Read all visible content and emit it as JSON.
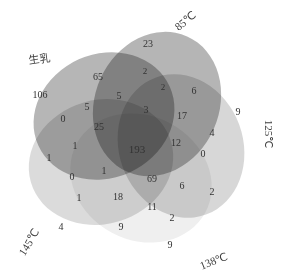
{
  "figure": {
    "type": "venn5",
    "title": "",
    "background": "#ffffff"
  },
  "sets": [
    {
      "id": "raw",
      "label": "生乳",
      "color": "#9a9a9a",
      "label_x": 40,
      "label_y": 60,
      "rotation": -8
    },
    {
      "id": "t85",
      "label": "85℃",
      "color": "#8e8e8e",
      "label_x": 186,
      "label_y": 22,
      "rotation": -38
    },
    {
      "id": "t125",
      "label": "125℃",
      "color": "#c3c3c3",
      "label_x": 268,
      "label_y": 134,
      "rotation": 90
    },
    {
      "id": "t138",
      "label": "138℃",
      "color": "#ececec",
      "label_x": 214,
      "label_y": 262,
      "rotation": -22
    },
    {
      "id": "t145",
      "label": "145℃",
      "color": "#c9c9c9",
      "label_x": 30,
      "label_y": 243,
      "rotation": -58
    }
  ],
  "chart_data": {
    "type": "venn",
    "sets": [
      "生乳",
      "85℃",
      "125℃",
      "138℃",
      "145℃"
    ],
    "title": "",
    "regions": [
      {
        "label": "106",
        "value": 106,
        "x": 40,
        "y": 96,
        "size": 10,
        "members": [
          "生乳"
        ]
      },
      {
        "label": "23",
        "value": 23,
        "x": 148,
        "y": 45,
        "size": 10,
        "members": [
          "85℃"
        ]
      },
      {
        "label": "9",
        "value": 9,
        "x": 238,
        "y": 113,
        "size": 10,
        "members": [
          "125℃"
        ]
      },
      {
        "label": "9",
        "value": 9,
        "x": 170,
        "y": 246,
        "size": 10,
        "members": [
          "138℃"
        ]
      },
      {
        "label": "4",
        "value": 4,
        "x": 61,
        "y": 228,
        "size": 10,
        "members": [
          "145℃"
        ]
      },
      {
        "label": "65",
        "value": 65,
        "x": 98,
        "y": 78,
        "size": 10,
        "members": [
          "生乳",
          "85℃"
        ]
      },
      {
        "label": "2",
        "value": 2,
        "x": 145,
        "y": 72,
        "size": 9,
        "members": [
          "85℃"
        ]
      },
      {
        "label": "2",
        "value": 2,
        "x": 163,
        "y": 88,
        "size": 9,
        "members": [
          "85℃",
          "125℃"
        ]
      },
      {
        "label": "6",
        "value": 6,
        "x": 194,
        "y": 92,
        "size": 10,
        "members": [
          "125℃"
        ]
      },
      {
        "label": "5",
        "value": 5,
        "x": 119,
        "y": 97,
        "size": 10,
        "members": [
          "生乳",
          "85℃"
        ]
      },
      {
        "label": "5",
        "value": 5,
        "x": 87,
        "y": 108,
        "size": 10,
        "members": [
          "生乳"
        ]
      },
      {
        "label": "0",
        "value": 0,
        "x": 63,
        "y": 120,
        "size": 10,
        "members": [
          "生乳",
          "145℃"
        ]
      },
      {
        "label": "25",
        "value": 25,
        "x": 99,
        "y": 128,
        "size": 10,
        "members": [
          "生乳",
          "145℃"
        ]
      },
      {
        "label": "3",
        "value": 3,
        "x": 146,
        "y": 111,
        "size": 10,
        "members": [
          "85℃",
          "125℃"
        ]
      },
      {
        "label": "17",
        "value": 17,
        "x": 182,
        "y": 117,
        "size": 10,
        "members": [
          "85℃",
          "125℃"
        ]
      },
      {
        "label": "4",
        "value": 4,
        "x": 212,
        "y": 134,
        "size": 10,
        "members": [
          "125℃"
        ]
      },
      {
        "label": "0",
        "value": 0,
        "x": 203,
        "y": 155,
        "size": 10,
        "members": [
          "125℃",
          "138℃"
        ]
      },
      {
        "label": "1",
        "value": 1,
        "x": 75,
        "y": 147,
        "size": 10,
        "members": [
          "生乳",
          "145℃"
        ]
      },
      {
        "label": "1",
        "value": 1,
        "x": 49,
        "y": 159,
        "size": 10,
        "members": [
          "生乳",
          "145℃"
        ]
      },
      {
        "label": "193",
        "value": 193,
        "x": 137,
        "y": 150,
        "size": 11,
        "members": [
          "生乳",
          "85℃",
          "125℃",
          "138℃",
          "145℃"
        ]
      },
      {
        "label": "12",
        "value": 12,
        "x": 176,
        "y": 144,
        "size": 10,
        "members": [
          "125℃",
          "138℃"
        ]
      },
      {
        "label": "0",
        "value": 0,
        "x": 72,
        "y": 178,
        "size": 10,
        "members": [
          "145℃"
        ]
      },
      {
        "label": "1",
        "value": 1,
        "x": 104,
        "y": 172,
        "size": 10,
        "members": [
          "145℃",
          "138℃"
        ]
      },
      {
        "label": "69",
        "value": 69,
        "x": 152,
        "y": 180,
        "size": 10,
        "members": [
          "138℃",
          "125℃"
        ]
      },
      {
        "label": "6",
        "value": 6,
        "x": 182,
        "y": 187,
        "size": 10,
        "members": [
          "138℃"
        ]
      },
      {
        "label": "2",
        "value": 2,
        "x": 212,
        "y": 193,
        "size": 10,
        "members": [
          "138℃",
          "125℃"
        ]
      },
      {
        "label": "1",
        "value": 1,
        "x": 79,
        "y": 199,
        "size": 10,
        "members": [
          "145℃"
        ]
      },
      {
        "label": "18",
        "value": 18,
        "x": 118,
        "y": 198,
        "size": 10,
        "members": [
          "145℃",
          "138℃"
        ]
      },
      {
        "label": "11",
        "value": 11,
        "x": 152,
        "y": 208,
        "size": 10,
        "members": [
          "138℃"
        ]
      },
      {
        "label": "2",
        "value": 2,
        "x": 172,
        "y": 219,
        "size": 10,
        "members": [
          "138℃"
        ]
      },
      {
        "label": "9",
        "value": 9,
        "x": 121,
        "y": 228,
        "size": 10,
        "members": [
          "145℃"
        ]
      }
    ]
  }
}
